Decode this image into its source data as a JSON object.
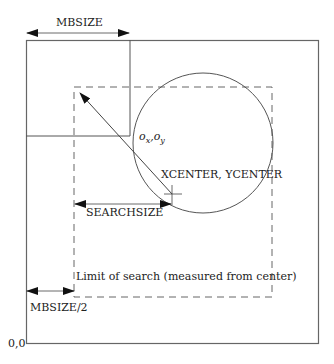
{
  "labels": {
    "mbsize": "MBSIZE",
    "origin_x": "o",
    "origin_x_sub": "x",
    "origin_sep": ",",
    "origin_y": "o",
    "origin_y_sub": "y",
    "center": "XCENTER, YCENTER",
    "searchsize": "SEARCHSIZE",
    "limit": "Limit of search (measured from center)",
    "mbsize_half": "MBSIZE/2",
    "coord_origin": "0,0"
  },
  "colors": {
    "line": "#555555",
    "text": "#222222"
  }
}
